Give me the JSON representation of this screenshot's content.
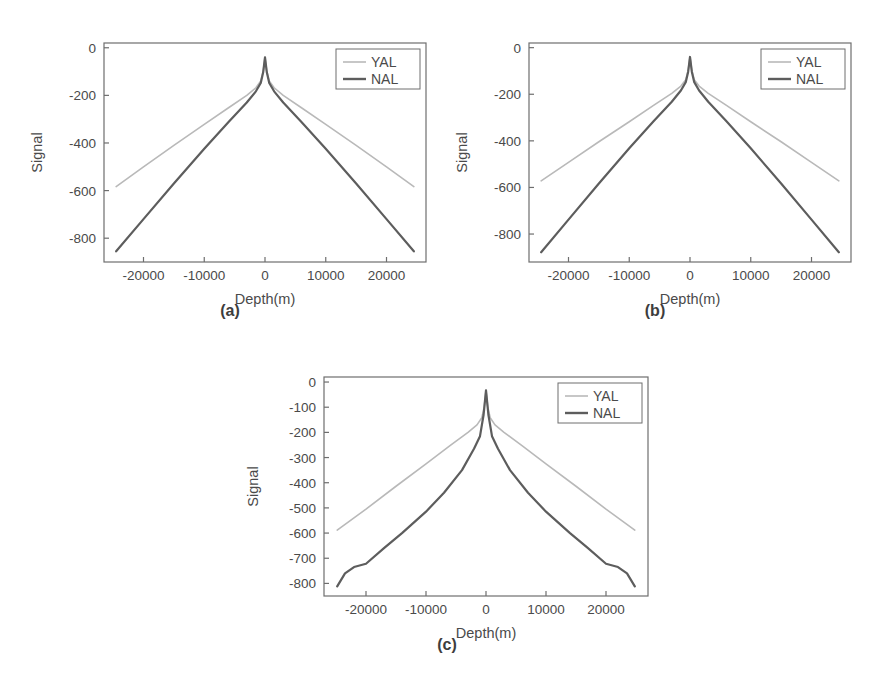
{
  "figure": {
    "panel_count": 3,
    "series_colors": {
      "YAL": "#b9b9b9",
      "NAL": "#5d5d5d"
    },
    "axis_color": "#6e6e6e",
    "background": "#ffffff"
  },
  "panels": [
    {
      "id": "a",
      "caption": "(a)",
      "chart_data": {
        "type": "line",
        "title": "",
        "xlabel": "Depth(m)",
        "ylabel": "Signal",
        "xlim": [
          -26500,
          26500
        ],
        "ylim": [
          -900,
          20
        ],
        "xticks": [
          -20000,
          -10000,
          0,
          10000,
          20000
        ],
        "xticklabels": [
          "-20000",
          "-10000",
          "0",
          "10000",
          "20000"
        ],
        "yticks": [
          0,
          -200,
          -400,
          -600,
          -800
        ],
        "yticklabels": [
          "0",
          "-200",
          "-400",
          "-600",
          "-800"
        ],
        "grid": false,
        "legend_position": "upper right",
        "series": [
          {
            "name": "YAL",
            "color": "#b9b9b9",
            "x": [
              -24500,
              -20000,
              -15000,
              -10000,
              -6000,
              -3000,
              -1500,
              -700,
              -300,
              0,
              300,
              700,
              1500,
              3000,
              6000,
              10000,
              15000,
              20000,
              24500
            ],
            "y": [
              -583,
              -500,
              -410,
              -322,
              -252,
              -200,
              -168,
              -140,
              -100,
              -40,
              -100,
              -140,
              -168,
              -200,
              -252,
              -322,
              -410,
              -500,
              -583
            ]
          },
          {
            "name": "NAL",
            "color": "#5d5d5d",
            "x": [
              -24500,
              -20000,
              -15000,
              -10000,
              -6000,
              -3000,
              -1500,
              -700,
              -300,
              0,
              300,
              700,
              1500,
              3000,
              6000,
              10000,
              15000,
              20000,
              24500
            ],
            "y": [
              -855,
              -720,
              -570,
              -424,
              -312,
              -230,
              -183,
              -148,
              -103,
              -40,
              -103,
              -148,
              -183,
              -230,
              -312,
              -424,
              -570,
              -720,
              -855
            ]
          }
        ]
      }
    },
    {
      "id": "b",
      "caption": "(b)",
      "chart_data": {
        "type": "line",
        "title": "",
        "xlabel": "Depth(m)",
        "ylabel": "Signal",
        "xlim": [
          -26500,
          26500
        ],
        "ylim": [
          -920,
          20
        ],
        "xticks": [
          -20000,
          -10000,
          0,
          10000,
          20000
        ],
        "xticklabels": [
          "-20000",
          "-10000",
          "0",
          "10000",
          "20000"
        ],
        "yticks": [
          0,
          -200,
          -400,
          -600,
          -800
        ],
        "yticklabels": [
          "0",
          "-200",
          "-400",
          "-600",
          "-800"
        ],
        "grid": false,
        "legend_position": "upper right",
        "series": [
          {
            "name": "YAL",
            "color": "#b9b9b9",
            "x": [
              -24500,
              -20000,
              -15000,
              -10000,
              -6000,
              -3000,
              -1500,
              -700,
              -300,
              0,
              300,
              700,
              1500,
              3000,
              6000,
              10000,
              15000,
              20000,
              24500
            ],
            "y": [
              -572,
              -492,
              -404,
              -318,
              -248,
              -196,
              -165,
              -138,
              -98,
              -40,
              -98,
              -138,
              -165,
              -196,
              -248,
              -318,
              -404,
              -492,
              -572
            ]
          },
          {
            "name": "NAL",
            "color": "#5d5d5d",
            "x": [
              -24500,
              -20000,
              -15000,
              -10000,
              -6000,
              -3000,
              -1500,
              -700,
              -300,
              0,
              300,
              700,
              1500,
              3000,
              6000,
              10000,
              15000,
              20000,
              24500
            ],
            "y": [
              -878,
              -738,
              -583,
              -432,
              -316,
              -232,
              -184,
              -148,
              -103,
              -40,
              -103,
              -148,
              -184,
              -232,
              -316,
              -432,
              -583,
              -738,
              -878
            ]
          }
        ]
      }
    },
    {
      "id": "c",
      "caption": "(c)",
      "chart_data": {
        "type": "line",
        "title": "",
        "xlabel": "Depth(m)",
        "ylabel": "Signal",
        "xlim": [
          -27000,
          27000
        ],
        "ylim": [
          -850,
          20
        ],
        "xticks": [
          -20000,
          -10000,
          0,
          10000,
          20000
        ],
        "xticklabels": [
          "-20000",
          "-10000",
          "0",
          "10000",
          "20000"
        ],
        "yticks": [
          0,
          -100,
          -200,
          -300,
          -400,
          -500,
          -600,
          -700,
          -800
        ],
        "yticklabels": [
          "0",
          "-100",
          "-200",
          "-300",
          "-400",
          "-500",
          "-600",
          "-700",
          "-800"
        ],
        "grid": false,
        "legend_position": "upper right",
        "series": [
          {
            "name": "YAL",
            "color": "#b9b9b9",
            "x": [
              -24800,
              -20000,
              -15000,
              -10000,
              -6000,
              -3000,
              -1500,
              -700,
              -300,
              0,
              300,
              700,
              1500,
              3000,
              6000,
              10000,
              15000,
              20000,
              24800
            ],
            "y": [
              -588,
              -505,
              -414,
              -325,
              -253,
              -200,
              -170,
              -142,
              -100,
              -33,
              -100,
              -142,
              -170,
              -200,
              -253,
              -325,
              -414,
              -505,
              -588
            ]
          },
          {
            "name": "NAL",
            "color": "#5d5d5d",
            "x": [
              -24800,
              -23500,
              -22000,
              -20000,
              -17000,
              -14000,
              -10000,
              -7000,
              -4000,
              -2000,
              -1000,
              -400,
              0,
              400,
              1000,
              2000,
              4000,
              7000,
              10000,
              14000,
              17000,
              20000,
              22000,
              23500,
              24800
            ],
            "y": [
              -812,
              -760,
              -735,
              -722,
              -660,
              -600,
              -515,
              -440,
              -350,
              -265,
              -215,
              -130,
              -33,
              -130,
              -215,
              -265,
              -350,
              -440,
              -515,
              -600,
              -660,
              -722,
              -735,
              -760,
              -812
            ]
          }
        ]
      }
    }
  ],
  "legend": {
    "entries": [
      {
        "label": "YAL",
        "color": "#b9b9b9"
      },
      {
        "label": "NAL",
        "color": "#5d5d5d"
      }
    ]
  }
}
